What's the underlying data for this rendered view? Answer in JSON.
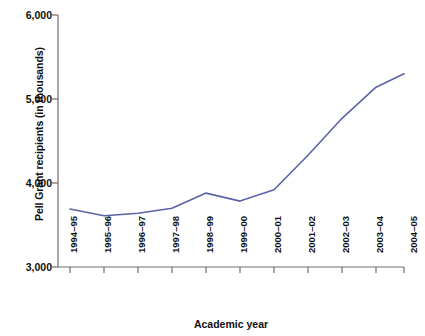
{
  "chart_data": {
    "type": "line",
    "title": "",
    "xlabel": "Academic year",
    "ylabel": "Pell Grant recipients (in thousands)",
    "categories": [
      "1994–95",
      "1995–96",
      "1996–97",
      "1997–98",
      "1998–99",
      "1999–00",
      "2000–01",
      "2001–02",
      "2002–03",
      "2003–04",
      "2004–05"
    ],
    "values": [
      3690,
      3610,
      3640,
      3700,
      3880,
      3785,
      3920,
      4330,
      4770,
      5140,
      5300
    ],
    "series": [
      {
        "name": "Pell Grant recipients",
        "values": [
          3690,
          3610,
          3640,
          3700,
          3880,
          3785,
          3920,
          4330,
          4770,
          5140,
          5300
        ]
      }
    ],
    "ylim": [
      3000,
      6000
    ],
    "yticks": [
      3000,
      4000,
      5000,
      6000
    ],
    "ytick_labels": [
      "3,000",
      "4,000",
      "5,000",
      "6,000"
    ],
    "grid": false,
    "legend": false,
    "legend_position": "none",
    "line_color": "#5c63a8",
    "axis_color": "#6f6f6f"
  },
  "axes": {
    "x_title": "Academic year",
    "y_title": "Pell Grant recipients (in thousands)",
    "y_labels": [
      "6,000",
      "5,000",
      "4,000",
      "3,000"
    ],
    "x_labels": [
      "1994–95",
      "1995–96",
      "1996–97",
      "1997–98",
      "1998–99",
      "1999–00",
      "2000–01",
      "2001–02",
      "2002–03",
      "2003–04",
      "2004–05"
    ]
  }
}
